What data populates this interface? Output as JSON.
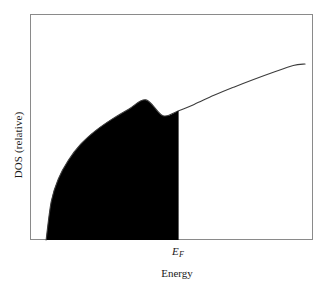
{
  "figure": {
    "background_color": "#ffffff",
    "frame_color": "#8a8a8a",
    "curve_color": "#3d3d3d",
    "fill_color": "#000000"
  },
  "chart_data": {
    "type": "area",
    "title": "",
    "subtitle": "",
    "xlabel": "Energy",
    "ylabel": "DOS (relative)",
    "grid": false,
    "legend": null,
    "xlim": [
      0,
      1
    ],
    "ylim": [
      0,
      1
    ],
    "xticks": [],
    "yticks": [],
    "xtick_labels": [],
    "ytick_labels": [],
    "annotations": [
      {
        "name": "fermi-level",
        "symbol": "E",
        "subscript": "F",
        "x": 0.523,
        "description": "Fermi energy marking the edge of the filled states"
      }
    ],
    "series": [
      {
        "name": "Density of states",
        "description": "Free-electron-like density of states proportional to the square root of energy",
        "x": [
          0.057,
          0.075,
          0.1,
          0.135,
          0.18,
          0.23,
          0.29,
          0.35,
          0.41,
          0.47,
          0.523,
          0.58,
          0.65,
          0.72,
          0.79,
          0.86,
          0.93,
          0.972
        ],
        "y": [
          0.0,
          0.17,
          0.27,
          0.352,
          0.425,
          0.482,
          0.535,
          0.58,
          0.62,
          0.55,
          0.571,
          0.6,
          0.64,
          0.676,
          0.71,
          0.742,
          0.772,
          0.779
        ]
      }
    ],
    "fill": {
      "name": "occupied-states",
      "color": "#000000",
      "x_from": 0.057,
      "x_to": 0.523,
      "description": "Solid black region under the curve up to the Fermi energy representing occupied electron states"
    }
  },
  "labels": {
    "ylabel": "DOS (relative)",
    "xlabel": "Energy",
    "fermi_symbol": "E",
    "fermi_subscript": "F"
  }
}
